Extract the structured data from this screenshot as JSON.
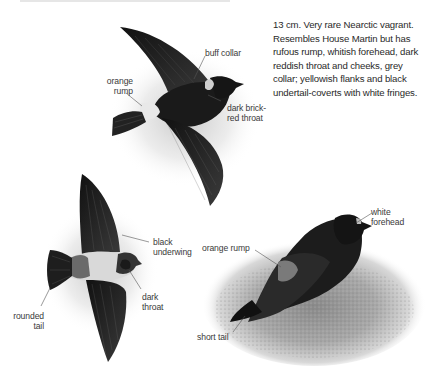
{
  "species": {
    "description": "13 cm. Very rare Nearctic vagrant. Resembles House Martin but has rufous rump, whitish forehead, dark reddish throat and cheeks, grey collar; yellowish flanks and black undertail-coverts with white fringes."
  },
  "figures": [
    {
      "name": "flight-upperside",
      "labels": [
        {
          "id": "buff-collar",
          "text": "buff collar"
        },
        {
          "id": "orange-rump-line1",
          "text": "orange"
        },
        {
          "id": "orange-rump-line2",
          "text": "rump"
        },
        {
          "id": "dark-brick-line1",
          "text": "dark brick-"
        },
        {
          "id": "dark-brick-line2",
          "text": "red throat"
        }
      ]
    },
    {
      "name": "flight-underside",
      "labels": [
        {
          "id": "black-underwing-line1",
          "text": "black"
        },
        {
          "id": "black-underwing-line2",
          "text": "underwing"
        },
        {
          "id": "dark-throat-line1",
          "text": "dark"
        },
        {
          "id": "dark-throat-line2",
          "text": "throat"
        },
        {
          "id": "rounded-tail-line1",
          "text": "rounded"
        },
        {
          "id": "rounded-tail-line2",
          "text": "tail"
        }
      ]
    },
    {
      "name": "perched",
      "labels": [
        {
          "id": "white-forehead-line1",
          "text": "white"
        },
        {
          "id": "white-forehead-line2",
          "text": "forehead"
        },
        {
          "id": "orange-rump",
          "text": "orange rump"
        },
        {
          "id": "short-tail",
          "text": "short tail"
        }
      ]
    }
  ],
  "colors": {
    "background": "#ffffff",
    "bird_dark": "#1c1c1c",
    "text": "#333333",
    "leader_line": "#555555"
  }
}
